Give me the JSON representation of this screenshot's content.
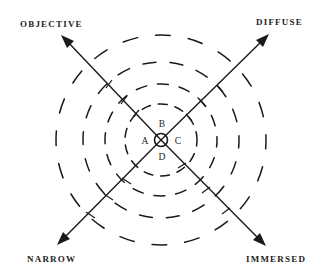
{
  "diagram": {
    "type": "radial-quadrant",
    "center": {
      "x": 161,
      "y": 140
    },
    "center_circle_radius": 6,
    "ring_radii": [
      36,
      56,
      78,
      105
    ],
    "axes": [
      {
        "id": "objective",
        "label": "OBJECTIVE",
        "direction": "north-west"
      },
      {
        "id": "diffuse",
        "label": "DIFFUSE",
        "direction": "north-east"
      },
      {
        "id": "narrow",
        "label": "NARROW",
        "direction": "south-west"
      },
      {
        "id": "immersed",
        "label": "IMMERSED",
        "direction": "south-east"
      }
    ],
    "quadrants": [
      {
        "id": "A",
        "label": "A",
        "position": "left"
      },
      {
        "id": "B",
        "label": "B",
        "position": "top"
      },
      {
        "id": "C",
        "label": "C",
        "position": "right"
      },
      {
        "id": "D",
        "label": "D",
        "position": "bottom"
      }
    ],
    "colors": {
      "ink": "#1a1a1a",
      "background": "#ffffff"
    }
  }
}
